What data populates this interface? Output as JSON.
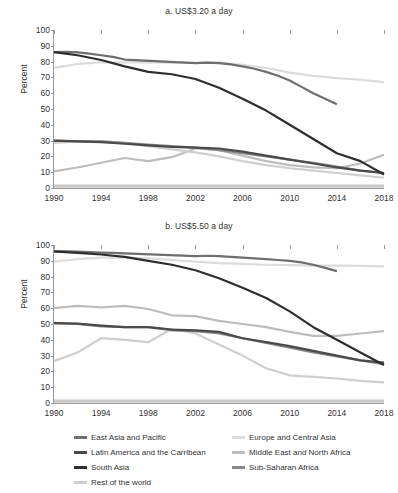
{
  "figure": {
    "ylabel": "Percent",
    "legend": {
      "columns": [
        [
          {
            "label": "East Asia and Pacific",
            "color": "#6e6e6e"
          },
          {
            "label": "Latin America and the Carribean",
            "color": "#4a4a4a"
          },
          {
            "label": "South Asia",
            "color": "#2e2e2e"
          },
          {
            "label": "Rest of the world",
            "color": "#cfcfcf"
          }
        ],
        [
          {
            "label": "Europe and Central Asia",
            "color": "#dcdcdc"
          },
          {
            "label": "Middle East and North Africa",
            "color": "#bdbdbd"
          },
          {
            "label": "Sub-Saharan Africa",
            "color": "#8a8a8a"
          }
        ]
      ]
    }
  },
  "chart_data": [
    {
      "type": "line",
      "panel": "a",
      "title": "a. US$3.20 a day",
      "xlabel": "",
      "ylabel": "Percent",
      "xlim": [
        1990,
        2018
      ],
      "ylim": [
        0,
        100
      ],
      "yticks": [
        0,
        10,
        20,
        30,
        40,
        50,
        60,
        70,
        80,
        90,
        100
      ],
      "xticks": [
        1990,
        1994,
        1998,
        2002,
        2006,
        2010,
        2014,
        2018
      ],
      "grid": false,
      "legend_position": "below-figure",
      "series": [
        {
          "name": "East Asia and Pacific",
          "color": "#6e6e6e",
          "x": [
            1990,
            1991,
            1992,
            1993,
            1994,
            1995,
            1996,
            2002,
            2003,
            2004,
            2005,
            2006,
            2007,
            2008,
            2009,
            2010,
            2011,
            2012,
            2013,
            2014
          ],
          "y": [
            86.0,
            86.2,
            85.8,
            85.0,
            84.0,
            83.0,
            81.3,
            79.0,
            79.3,
            79.0,
            78.2,
            77.0,
            75.5,
            73.5,
            71.0,
            68.0,
            64.0,
            60.0,
            56.5,
            53.0
          ]
        },
        {
          "name": "Latin America and the Carribean",
          "color": "#4a4a4a",
          "x": [
            1990,
            1992,
            1994,
            1996,
            1998,
            2000,
            2002,
            2004,
            2006,
            2008,
            2010,
            2012,
            2014,
            2016,
            2018
          ],
          "y": [
            30.0,
            29.5,
            29.0,
            28.0,
            27.0,
            26.0,
            25.5,
            25.0,
            23.0,
            20.5,
            18.0,
            15.5,
            13.0,
            11.0,
            9.5
          ]
        },
        {
          "name": "South Asia",
          "color": "#2e2e2e",
          "x": [
            1990,
            1992,
            1994,
            1996,
            1998,
            2000,
            2002,
            2004,
            2006,
            2008,
            2010,
            2012,
            2014,
            2016,
            2018
          ],
          "y": [
            86.0,
            84.0,
            81.0,
            77.0,
            73.5,
            72.0,
            69.0,
            63.5,
            56.5,
            49.0,
            40.0,
            31.0,
            22.0,
            17.0,
            8.5
          ]
        },
        {
          "name": "Rest of the world",
          "color": "#cfcfcf",
          "x": [
            1990,
            1992,
            1994,
            1996,
            1998,
            2000,
            2002,
            2004,
            2006,
            2008,
            2010,
            2012,
            2014,
            2016,
            2018
          ],
          "y": [
            28.5,
            29.5,
            29.5,
            28.5,
            26.5,
            24.5,
            22.5,
            20.0,
            17.0,
            14.5,
            12.5,
            11.0,
            9.5,
            8.0,
            6.5
          ]
        },
        {
          "name": "Europe and Central Asia",
          "color": "#dcdcdc",
          "x": [
            1990,
            1992,
            1994,
            1996,
            1998,
            2000,
            2002,
            2004,
            2006,
            2008,
            2010,
            2012,
            2014,
            2016,
            2018
          ],
          "y": [
            76.0,
            78.5,
            79.5,
            79.5,
            79.5,
            79.3,
            79.2,
            79.5,
            78.0,
            76.0,
            73.0,
            71.0,
            69.5,
            68.5,
            67.0
          ]
        },
        {
          "name": "Middle East and North Africa",
          "color": "#bdbdbd",
          "x": [
            1990,
            1992,
            1994,
            1996,
            1998,
            2000,
            2002,
            2004,
            2006,
            2008,
            2010,
            2012,
            2014,
            2016,
            2018
          ],
          "y": [
            10.5,
            13.0,
            16.0,
            19.0,
            17.0,
            19.5,
            25.0,
            24.0,
            20.5,
            17.0,
            14.5,
            13.0,
            12.5,
            15.5,
            21.0
          ]
        },
        {
          "name": "Sub-Saharan Africa",
          "color": "#8a8a8a",
          "x": [
            1990,
            1992,
            1994,
            1996,
            1998,
            2000,
            2002,
            2004,
            2006,
            2008,
            2010,
            2012,
            2014,
            2016,
            2018
          ],
          "y": [
            30.0,
            29.5,
            29.5,
            28.5,
            27.5,
            26.5,
            25.5,
            24.0,
            22.0,
            20.0,
            18.0,
            16.0,
            13.5,
            11.0,
            9.5
          ]
        }
      ]
    },
    {
      "type": "line",
      "panel": "b",
      "title": "b. US$5.50 a day",
      "xlabel": "",
      "ylabel": "Percent",
      "xlim": [
        1990,
        2018
      ],
      "ylim": [
        0,
        100
      ],
      "yticks": [
        0,
        10,
        20,
        30,
        40,
        50,
        60,
        70,
        80,
        90,
        100
      ],
      "xticks": [
        1990,
        1994,
        1998,
        2002,
        2006,
        2010,
        2014,
        2018
      ],
      "grid": false,
      "legend_position": "below-figure",
      "series": [
        {
          "name": "East Asia and Pacific",
          "color": "#6e6e6e",
          "x": [
            1990,
            1991,
            1992,
            1993,
            1994,
            1995,
            1996,
            2002,
            2003,
            2004,
            2005,
            2006,
            2007,
            2008,
            2009,
            2010,
            2011,
            2012,
            2013,
            2014
          ],
          "y": [
            96.0,
            96.0,
            95.8,
            95.5,
            95.2,
            95.0,
            94.7,
            93.0,
            93.2,
            93.0,
            92.5,
            92.0,
            91.5,
            91.0,
            90.5,
            90.0,
            89.0,
            87.5,
            85.5,
            83.5
          ]
        },
        {
          "name": "Latin America and the Carribean",
          "color": "#4a4a4a",
          "x": [
            1990,
            1992,
            1994,
            1996,
            1998,
            2000,
            2002,
            2004,
            2006,
            2008,
            2010,
            2012,
            2014,
            2016,
            2018
          ],
          "y": [
            50.5,
            50.3,
            49.0,
            48.0,
            48.0,
            46.5,
            46.0,
            45.0,
            41.0,
            38.5,
            36.0,
            33.0,
            30.0,
            27.0,
            25.5
          ]
        },
        {
          "name": "South Asia",
          "color": "#2e2e2e",
          "x": [
            1990,
            1992,
            1994,
            1996,
            1998,
            2000,
            2002,
            2004,
            2006,
            2008,
            2010,
            2012,
            2014,
            2016,
            2018
          ],
          "y": [
            96.0,
            95.0,
            94.0,
            92.5,
            90.0,
            87.5,
            84.0,
            79.0,
            73.0,
            66.5,
            58.0,
            48.0,
            40.0,
            32.0,
            24.0
          ]
        },
        {
          "name": "Rest of the world",
          "color": "#cfcfcf",
          "x": [
            1990,
            1992,
            1994,
            1996,
            1998,
            2000,
            2002,
            2004,
            2006,
            2008,
            2010,
            2012,
            2014,
            2016,
            2018
          ],
          "y": [
            26.5,
            32.0,
            41.0,
            40.0,
            38.5,
            47.0,
            44.0,
            37.0,
            30.0,
            22.0,
            17.5,
            16.5,
            15.5,
            14.0,
            13.0
          ]
        },
        {
          "name": "Europe and Central Asia",
          "color": "#dcdcdc",
          "x": [
            1990,
            1992,
            1994,
            1996,
            1998,
            2000,
            2002,
            2004,
            2006,
            2008,
            2010,
            2012,
            2014,
            2016,
            2018
          ],
          "y": [
            89.5,
            91.0,
            92.0,
            92.0,
            91.5,
            90.5,
            89.5,
            88.5,
            88.0,
            87.5,
            87.2,
            87.0,
            87.0,
            86.8,
            86.5
          ]
        },
        {
          "name": "Middle East and North Africa",
          "color": "#bdbdbd",
          "x": [
            1990,
            1992,
            1994,
            1996,
            1998,
            2000,
            2002,
            2004,
            2006,
            2008,
            2010,
            2012,
            2014,
            2016,
            2018
          ],
          "y": [
            60.0,
            61.5,
            60.5,
            61.5,
            59.5,
            55.5,
            55.0,
            52.0,
            50.0,
            48.0,
            45.0,
            42.5,
            42.5,
            44.0,
            45.5
          ]
        },
        {
          "name": "Sub-Saharan Africa",
          "color": "#8a8a8a",
          "x": [
            1990,
            1992,
            1994,
            1996,
            1998,
            2000,
            2002,
            2004,
            2006,
            2008,
            2010,
            2012,
            2014,
            2016,
            2018
          ],
          "y": [
            50.5,
            50.0,
            48.5,
            48.0,
            48.0,
            46.0,
            45.5,
            44.0,
            41.0,
            38.0,
            35.0,
            32.0,
            29.5,
            27.0,
            24.5
          ]
        }
      ]
    }
  ]
}
